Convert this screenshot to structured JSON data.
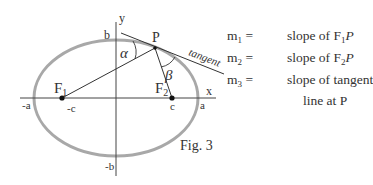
{
  "diagram": {
    "axis_labels": {
      "x": "x",
      "y": "y"
    },
    "tick_labels": {
      "neg_a": "-a",
      "a": "a",
      "neg_c": "-c",
      "c": "c",
      "b": "b",
      "neg_b": "-b"
    },
    "points": {
      "F1": {
        "label": "F",
        "sub": "1"
      },
      "F2": {
        "label": "F",
        "sub": "2"
      },
      "P": {
        "label": "P"
      }
    },
    "angles": {
      "alpha": "α",
      "beta": "β"
    },
    "tangent_label": "tangent",
    "colors": {
      "ellipse": "#a8a8a8",
      "lines": "#333333"
    }
  },
  "legend": [
    {
      "sym": "m",
      "sub": "1",
      "text": "slope of F",
      "text_sub": "1",
      "text_tail": "P"
    },
    {
      "sym": "m",
      "sub": "2",
      "text": "slope of F",
      "text_sub": "2",
      "text_tail": "P"
    },
    {
      "sym": "m",
      "sub": "3",
      "text": "slope of tangent",
      "text_sub": "",
      "text_tail": ""
    }
  ],
  "legend_continuation": "line at P",
  "equals": "=",
  "caption": "Fig. 3"
}
